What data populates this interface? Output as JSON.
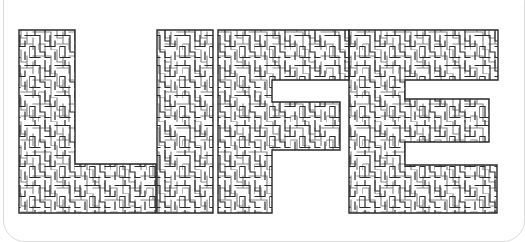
{
  "image": {
    "description": "Maze puzzle shaped like the word LIFE",
    "word": "LIFE",
    "letters": [
      {
        "char": "L",
        "label": "letter-L"
      },
      {
        "char": "I",
        "label": "letter-I"
      },
      {
        "char": "F",
        "label": "letter-F"
      },
      {
        "char": "E",
        "label": "letter-E"
      }
    ],
    "colors": {
      "background": "#ffffff",
      "maze_lines": "#2a2a2a",
      "frame": "#dcdcdc"
    }
  }
}
